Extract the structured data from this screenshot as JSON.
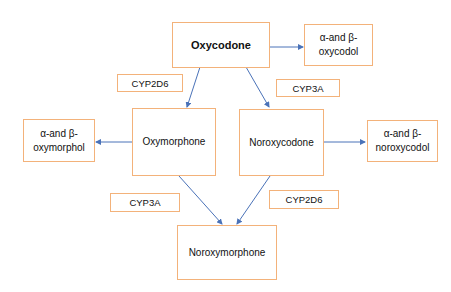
{
  "diagram": {
    "nodes": {
      "oxycodone": "Oxycodone",
      "oxycodol": [
        "α-and β-",
        "oxycodol"
      ],
      "oxymorphone": "Oxymorphone",
      "noroxycodone": "Noroxycodone",
      "oxymorphol": [
        "α-and β-",
        "oxymorphol"
      ],
      "noroxycodol": [
        "α-and β-",
        "noroxycodol"
      ],
      "noroxymorphone": "Noroxymorphone"
    },
    "enzymes": {
      "e1": "CYP2D6",
      "e2": "CYP3A",
      "e3": "CYP3A",
      "e4": "CYP2D6"
    },
    "edges": [
      {
        "from": "Oxycodone",
        "to": "α-and β-oxycodol"
      },
      {
        "from": "Oxycodone",
        "to": "Oxymorphone",
        "enzyme": "CYP2D6"
      },
      {
        "from": "Oxycodone",
        "to": "Noroxycodone",
        "enzyme": "CYP3A"
      },
      {
        "from": "Oxymorphone",
        "to": "α-and β-oxymorphol"
      },
      {
        "from": "Noroxycodone",
        "to": "α-and β-noroxycodol"
      },
      {
        "from": "Oxymorphone",
        "to": "Noroxymorphone",
        "enzyme": "CYP3A"
      },
      {
        "from": "Noroxycodone",
        "to": "Noroxymorphone",
        "enzyme": "CYP2D6"
      }
    ],
    "colors": {
      "box_border": "#f3b27a",
      "arrow": "#4a72b8"
    }
  }
}
